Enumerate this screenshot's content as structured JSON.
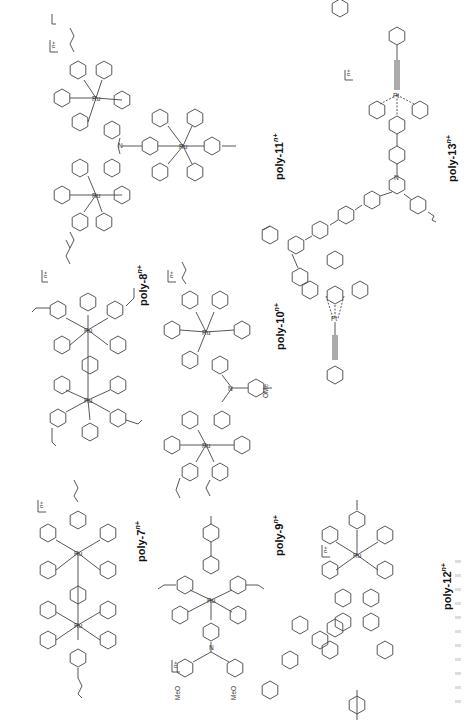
{
  "figure": {
    "orientation": "rotated-90-ccw",
    "line_color": "#444444",
    "compounds": [
      {
        "id": "poly-7",
        "label": "poly-7",
        "charge": "n+",
        "metal": "Ru",
        "substituents": []
      },
      {
        "id": "poly-8",
        "label": "poly-8",
        "charge": "n+",
        "metal": "Ru",
        "substituents": []
      },
      {
        "id": "poly-9",
        "label": "poly-9",
        "charge": "n+",
        "metal": "Ru",
        "substituents": [
          "MeO",
          "MeO"
        ]
      },
      {
        "id": "poly-10",
        "label": "poly-10",
        "charge": "n+",
        "metal": "Ru",
        "substituents": [
          "OMe"
        ]
      },
      {
        "id": "poly-11",
        "label": "poly-11",
        "charge": "n+",
        "metal": "Ru",
        "substituents": []
      },
      {
        "id": "poly-12",
        "label": "poly-12",
        "charge": "n+",
        "metal": "Ru",
        "substituents": []
      },
      {
        "id": "poly-13",
        "label": "poly-13",
        "charge": "n+",
        "metal": "Pt",
        "substituents": []
      }
    ],
    "atoms": {
      "n": "N",
      "ru": "Ru",
      "pt": "Pt",
      "meo": "MeO",
      "ome": "OMe"
    },
    "bracket_charge": "n+"
  }
}
